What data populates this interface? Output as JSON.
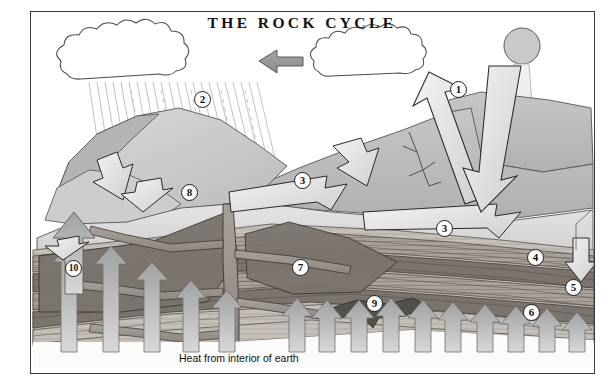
{
  "figure": {
    "title": "THE ROCK CYCLE",
    "bottom_caption": "Heat from interior of earth",
    "frame_border_color": "#3a3a3a",
    "background_color": "#ffffff"
  },
  "colors": {
    "arrow_gray": "#9a9a9a",
    "arrow_gray_dark": "#7e7e7e",
    "outline": "#1d1d1d",
    "sun_fill": "#c9c9c9",
    "cloud_fill": "#ffffff",
    "surface_light": "#dedede",
    "surface_mid": "#bdbdbd",
    "surface_dark": "#a7a7a7",
    "strata_light": "#cfc9c3",
    "strata_mid": "#a39c95",
    "strata_dark": "#6f6760",
    "magma": "#9b948c",
    "rain_line": "#b9b9b9"
  },
  "labels": [
    {
      "id": "1",
      "text": "1",
      "x": 458,
      "y": 88,
      "meaning": "solar-energy-evaporation"
    },
    {
      "id": "2",
      "text": "2",
      "x": 199,
      "y": 97,
      "meaning": "precipitation"
    },
    {
      "id": "3a",
      "text": "3",
      "x": 299,
      "y": 176,
      "meaning": "erosion-transport-upper"
    },
    {
      "id": "3b",
      "text": "3",
      "x": 442,
      "y": 224,
      "meaning": "erosion-transport-lower"
    },
    {
      "id": "4",
      "text": "4",
      "x": 533,
      "y": 254,
      "meaning": "deposition"
    },
    {
      "id": "5",
      "text": "5",
      "x": 570,
      "y": 283,
      "meaning": "compaction-cementation"
    },
    {
      "id": "6",
      "text": "6",
      "x": 529,
      "y": 308,
      "meaning": "sedimentary-rock"
    },
    {
      "id": "7",
      "text": "7",
      "x": 297,
      "y": 263,
      "meaning": "metamorphic-rock"
    },
    {
      "id": "8",
      "text": "8",
      "x": 186,
      "y": 188,
      "meaning": "volcanic-conduit-outcrop"
    },
    {
      "id": "9",
      "text": "9",
      "x": 371,
      "y": 299,
      "meaning": "magma-intrusion"
    },
    {
      "id": "10",
      "text": "10",
      "x": 70,
      "y": 264,
      "meaning": "uplift"
    }
  ],
  "scene": {
    "sun": {
      "label": "sun",
      "cx": 521,
      "cy": 45,
      "r": 18
    },
    "clouds": [
      {
        "name": "rain-cloud-left",
        "x": 62,
        "y": 30,
        "w": 175,
        "h": 45
      },
      {
        "name": "vapor-cloud-right",
        "x": 314,
        "y": 30,
        "w": 135,
        "h": 45
      }
    ],
    "cloud_transfer_arrow": {
      "name": "cloud-to-cloud-arrow",
      "direction": "left"
    },
    "rain_band": {
      "name": "precipitation-hatching",
      "lines": 22
    },
    "heat_arrows_count": 15,
    "heat_arrow_direction": "up",
    "uplift_arrow": {
      "name": "uplift-arrow",
      "direction": "up"
    },
    "deposition_arrow": {
      "name": "deposition-arrow",
      "direction": "down"
    },
    "erosion_arrows_count": 6,
    "solar_beam": {
      "name": "solar-beam",
      "direction": "down"
    },
    "evaporation_arrow": {
      "name": "evaporation-arrow",
      "direction": "up-left"
    }
  }
}
